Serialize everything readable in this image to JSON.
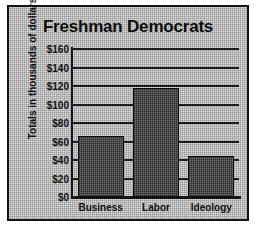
{
  "chart_data": {
    "type": "bar",
    "title": "Freshman Democrats",
    "xlabel": "",
    "ylabel": "Totals in thousands of dollars",
    "categories": [
      "Business",
      "Labor",
      "Ideology"
    ],
    "values": [
      66,
      118,
      44
    ],
    "ylim": [
      0,
      160
    ],
    "ytick_values": [
      0,
      20,
      40,
      60,
      80,
      100,
      120,
      140,
      160
    ],
    "ytick_labels": [
      "$0",
      "$20",
      "$40",
      "$60",
      "$80",
      "$100",
      "$120",
      "$140",
      "$160"
    ],
    "grid": "horizontal",
    "legend": "none",
    "bar_color": "#2a2a2a",
    "background_color": "#dedede",
    "frame_color": "#141414"
  }
}
